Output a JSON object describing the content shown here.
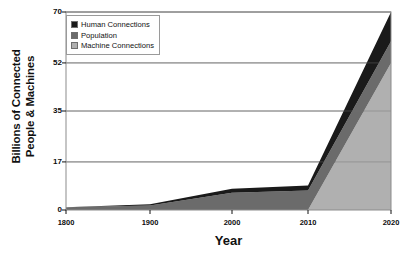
{
  "chart_data": {
    "type": "area",
    "stacked": true,
    "title": "",
    "xlabel": "Year",
    "ylabel": "Billions of Connected People & Machines",
    "ylabel_lines": [
      "Billions of Connected",
      "People & Machines"
    ],
    "x": [
      1800,
      1900,
      2000,
      2010,
      2020
    ],
    "xtick_labels": [
      "1800",
      "1900",
      "2000",
      "2010",
      "2020"
    ],
    "ytick_labels": [
      "0",
      "17",
      "35",
      "52",
      "70"
    ],
    "ytick_values": [
      0,
      17,
      35,
      52,
      70
    ],
    "xlim": [
      1800,
      2020
    ],
    "ylim": [
      0,
      70
    ],
    "grid": "horizontal",
    "legend_position": "top-left",
    "series": [
      {
        "name": "Machine Connections",
        "color": "#b0b0b0",
        "values": [
          0,
          0,
          0,
          0,
          52
        ]
      },
      {
        "name": "Population",
        "color": "#6b6b6b",
        "values": [
          1,
          1.6,
          6.1,
          6.9,
          7.7
        ]
      },
      {
        "name": "Human Connections",
        "color": "#1a1a1a",
        "values": [
          0,
          0.4,
          1.4,
          1.8,
          10.3
        ]
      }
    ],
    "series_order_bottom_to_top": [
      "Machine Connections",
      "Population",
      "Human Connections"
    ],
    "totals": [
      1,
      2,
      7.5,
      8.7,
      70
    ]
  },
  "legend": {
    "items": [
      {
        "label": "Human Connections",
        "color": "#1a1a1a"
      },
      {
        "label": "Population",
        "color": "#6b6b6b"
      },
      {
        "label": "Machine Connections",
        "color": "#b0b0b0"
      }
    ]
  },
  "axes": {
    "frame_color": "#8c8c8c",
    "grid_color": "#7d7d7d",
    "tick_color": "#111111"
  }
}
